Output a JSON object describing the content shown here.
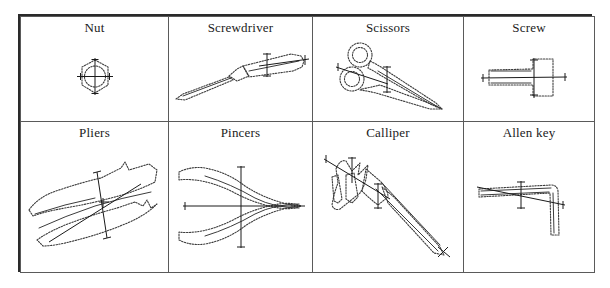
{
  "figure": {
    "type": "tool-sketch-table",
    "rows": 2,
    "columns": 4,
    "border_color": "#2a2a2a",
    "grid_color": "#5a5a5a",
    "stroke_color": "#3c3c3c",
    "axis_color": "#1a1a1a",
    "background": "#ffffff"
  },
  "table": {
    "cells": [
      [
        {
          "label": "Nut",
          "icon": "nut-sketch"
        },
        {
          "label": "Screwdriver",
          "icon": "screwdriver-sketch"
        },
        {
          "label": "Scissors",
          "icon": "scissors-sketch"
        },
        {
          "label": "Screw",
          "icon": "screw-sketch"
        }
      ],
      [
        {
          "label": "Pliers",
          "icon": "pliers-sketch"
        },
        {
          "label": "Pincers",
          "icon": "pincers-sketch"
        },
        {
          "label": "Calliper",
          "icon": "calliper-sketch"
        },
        {
          "label": "Allen key",
          "icon": "allen-key-sketch"
        }
      ]
    ]
  }
}
